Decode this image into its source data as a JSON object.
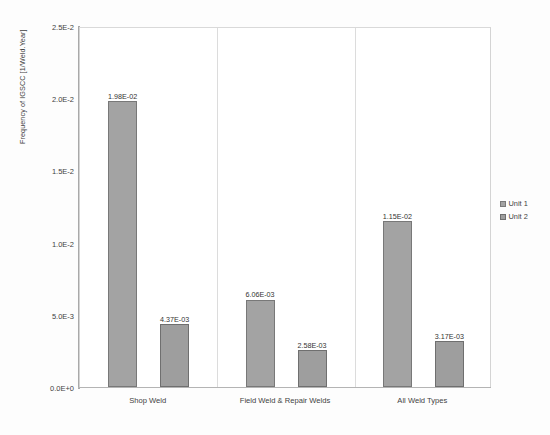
{
  "chart_data": {
    "type": "bar",
    "title": "",
    "xlabel": "",
    "ylabel": "Frequency of IGSCC [1/Weld.Year]",
    "categories": [
      "Shop Weld",
      "Field Weld & Repair Welds",
      "All Weld  Types"
    ],
    "series": [
      {
        "name": "Unit 1",
        "values": [
          0.0198,
          0.00606,
          0.0115
        ],
        "labels": [
          "1.98E-02",
          "6.06E-03",
          "1.15E-02"
        ],
        "color": "#a3a3a3"
      },
      {
        "name": "Unit 2",
        "values": [
          0.00437,
          0.00258,
          0.00317
        ],
        "labels": [
          "4.37E-03",
          "2.58E-03",
          "3.17E-03"
        ],
        "color": "#9e9e9e"
      }
    ],
    "ylim": [
      0,
      0.025
    ],
    "ytick_values": [
      0.025,
      0.02,
      0.015,
      0.01,
      0.005,
      0
    ],
    "ytick_labels": [
      "2.5E-2",
      "2.0E-2",
      "1.5E-2",
      "1.0E-2",
      "5.0E-3",
      "0.0E+0"
    ],
    "grid": false,
    "legend_position": "right",
    "legend_entries": [
      "Unit 1",
      "Unit 2"
    ]
  }
}
